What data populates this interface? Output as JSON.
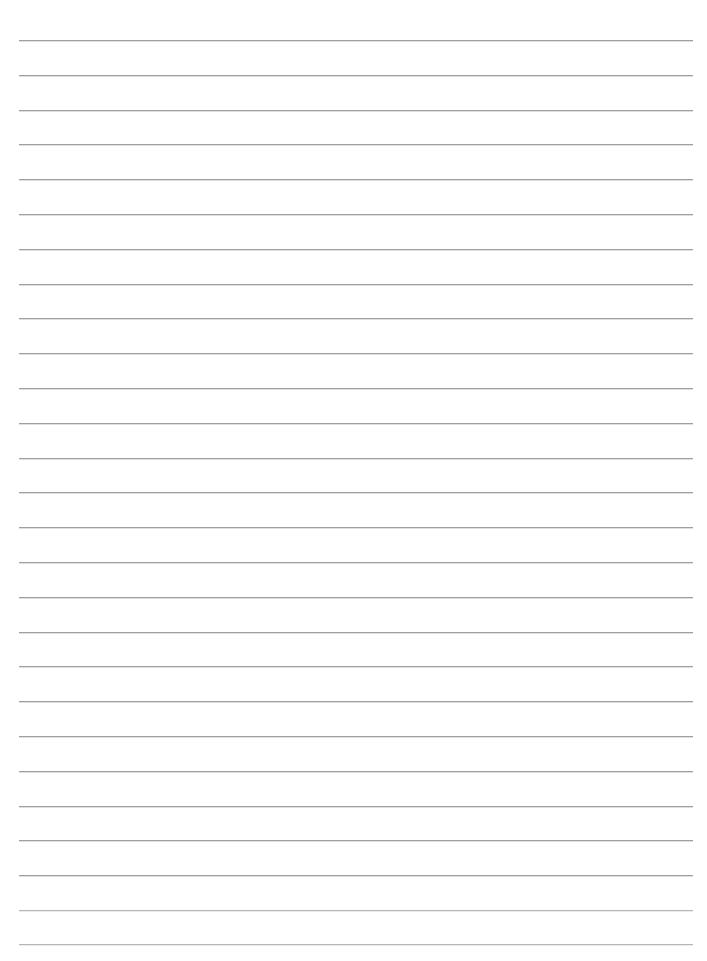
{
  "page": {
    "kind": "lined-paper-sheet",
    "width": 707,
    "height": 961,
    "background_color": "#ffffff",
    "title": "",
    "body_text": "",
    "header_text": "",
    "footer_text": ""
  },
  "ruling": {
    "line_color": "#9fa0a2",
    "line_color_faint": "#b4b6b8",
    "line_thickness": 1,
    "line_count": 27,
    "left_x": 19,
    "right_x": 693,
    "line_width": 674,
    "first_line_y": 40,
    "last_line_y": 944,
    "line_spacing": 34.77,
    "margin_rule_visible": false,
    "hole_punches_visible": false,
    "line_y_positions": [
      40,
      75,
      110,
      144,
      179,
      214,
      249,
      284,
      318,
      353,
      388,
      423,
      458,
      492,
      527,
      562,
      597,
      632,
      666,
      701,
      736,
      771,
      806,
      840,
      875,
      910,
      944
    ],
    "faint_line_indexes": [
      25,
      26
    ]
  }
}
